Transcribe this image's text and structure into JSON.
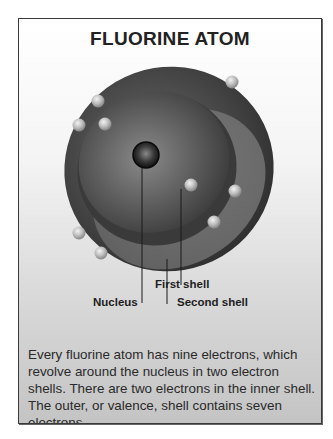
{
  "title": "FLUORINE ATOM",
  "labels": {
    "nucleus": "Nucleus",
    "first_shell": "First shell",
    "second_shell": "Second shell"
  },
  "caption": "Every fluorine atom has nine electrons, which revolve around the nucleus in two electron shells. There are two electrons in the inner shell. The outer, or valence, shell contains seven electrons.",
  "atom": {
    "element": "Fluorine",
    "electrons_total": 9,
    "inner_shell_electrons": 2,
    "outer_shell_electrons": 7
  },
  "colors": {
    "outer_shell": "#3c3c3c",
    "inner_shell": "#555555",
    "electron": "#b8b8b8",
    "nucleus": "#1a1a1a"
  }
}
